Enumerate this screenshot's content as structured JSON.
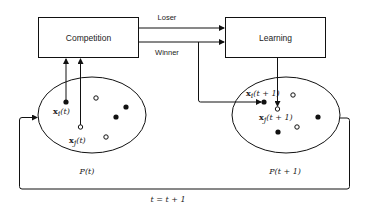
{
  "diagram": {
    "nodes": {
      "competition": {
        "label": "Competition"
      },
      "learning": {
        "label": "Learning"
      }
    },
    "edges": {
      "loser": {
        "label": "Loser",
        "from": "competition",
        "to": "learning"
      },
      "winner": {
        "label": "Winner",
        "from": "competition",
        "to": "learning"
      }
    },
    "populations": {
      "current": {
        "label": "P(t)",
        "points": {
          "xi": {
            "label_base": "x",
            "label_sub": "i",
            "label_arg": "(t)",
            "filled": true
          },
          "xj": {
            "label_base": "x",
            "label_sub": "j",
            "label_arg": "(t)",
            "filled": false
          }
        }
      },
      "next": {
        "label": "P(t + 1)",
        "points": {
          "xi": {
            "label_base": "x",
            "label_sub": "i",
            "label_arg": "(t + 1)",
            "filled": true
          },
          "xj": {
            "label_base": "x",
            "label_sub": "j",
            "label_arg": "(t + 1)",
            "filled": false
          }
        }
      }
    },
    "loop": {
      "label": "t = t + 1"
    }
  }
}
